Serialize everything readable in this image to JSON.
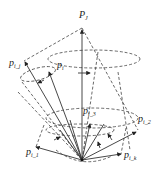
{
  "diagram": {
    "type": "vector-cone-diagram",
    "labels": {
      "apex": {
        "base": "P",
        "sub": "J"
      },
      "p_ij": {
        "base": "p",
        "sub": "i_j"
      },
      "p_i": {
        "base": "p",
        "sub": "i"
      },
      "p_i1": {
        "base": "p",
        "sub": "i_1"
      },
      "p_i2": {
        "base": "p",
        "sub": "i_2"
      },
      "p_i3": {
        "base": "p",
        "sub": "i_3"
      },
      "p_ik": {
        "base": "p",
        "sub": "i_k"
      }
    },
    "colors": {
      "stroke": "#333333",
      "background": "#ffffff"
    }
  }
}
